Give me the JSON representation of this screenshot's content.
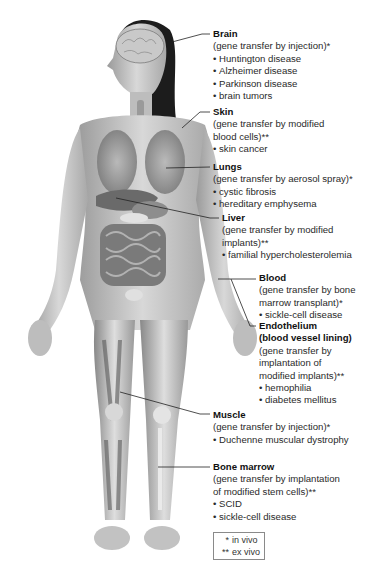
{
  "figure": {
    "leader_line_color": "#222222"
  },
  "labels": [
    {
      "id": "brain",
      "title": "Brain",
      "method": "(gene transfer by injection)*",
      "items": [
        "Huntington disease",
        "Alzheimer disease",
        "Parkinson disease",
        "brain tumors"
      ]
    },
    {
      "id": "skin",
      "title": "Skin",
      "method_lines": [
        "(gene transfer by modified",
        "blood cells)**"
      ],
      "items": [
        "skin cancer"
      ]
    },
    {
      "id": "lungs",
      "title": "Lungs",
      "method": "(gene transfer by aerosol spray)*",
      "items": [
        "cystic fibrosis",
        "hereditary emphysema"
      ]
    },
    {
      "id": "liver",
      "title": "Liver",
      "method_lines": [
        "(gene transfer by modified",
        "implants)**"
      ],
      "items": [
        "familial hypercholesterolemia"
      ]
    },
    {
      "id": "blood",
      "title": "Blood",
      "method_lines": [
        "(gene transfer by bone",
        "marrow transplant)*"
      ],
      "items": [
        "sickle-cell disease"
      ]
    },
    {
      "id": "endothelium",
      "title_lines": [
        "Endothelium",
        "(blood vessel lining)"
      ],
      "method_lines": [
        "(gene transfer by",
        "implantation of",
        "modified implants)**"
      ],
      "items": [
        "hemophilia",
        "diabetes mellitus"
      ]
    },
    {
      "id": "muscle",
      "title": "Muscle",
      "method": "(gene transfer by injection)*",
      "items": [
        "Duchenne muscular dystrophy"
      ]
    },
    {
      "id": "bone_marrow",
      "title": "Bone marrow",
      "method_lines": [
        "(gene transfer by implantation",
        "of modified stem cells)**"
      ],
      "items": [
        "SCID",
        "sickle-cell disease"
      ]
    }
  ],
  "legend": {
    "rows": [
      {
        "symbol": "*",
        "text": "in vivo"
      },
      {
        "symbol": "**",
        "text": "ex vivo"
      }
    ]
  }
}
